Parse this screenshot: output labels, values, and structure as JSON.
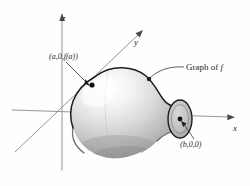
{
  "figure": {
    "background_color": "#fefefe",
    "ink_color": "#2b2b2b",
    "axis_color": "#8a8a8a"
  },
  "axes": [
    {
      "name": "z-axis",
      "label": "z",
      "direction": "up"
    },
    {
      "name": "y-axis",
      "label": "y",
      "direction": "up-right"
    },
    {
      "name": "x-axis",
      "label": "x",
      "direction": "right"
    }
  ],
  "annotations": [
    {
      "name": "point-a",
      "label": "(a,0,f(a))",
      "marker": "dot",
      "leader": "line"
    },
    {
      "name": "point-b",
      "label": "(b,0,0)",
      "marker": "dot",
      "leader": "line"
    },
    {
      "name": "graph-callout",
      "label_prefix": "Graph of ",
      "label_symbol": "f",
      "leader": "curve"
    }
  ],
  "surface": {
    "name": "surface-of-revolution",
    "shape": "vase-bulb",
    "shading": "grayscale-gradient",
    "highlight_color": "#fbfbfb",
    "shadow_color": "#8d8d8d",
    "outline_color": "#1e1e1e",
    "open_end": "right-ellipse"
  }
}
